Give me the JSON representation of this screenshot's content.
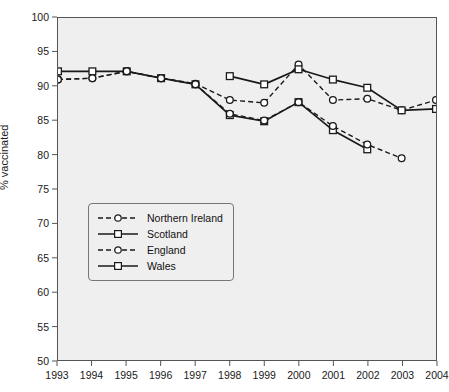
{
  "chart_data": {
    "type": "line",
    "title": "",
    "xlabel": "",
    "ylabel": "% vaccinated",
    "x": [
      1993,
      1994,
      1995,
      1996,
      1997,
      1998,
      1999,
      2000,
      2001,
      2002,
      2003,
      2004
    ],
    "xtick_labels": [
      "1993",
      "1994",
      "1995",
      "1996",
      "1997",
      "1998",
      "1999",
      "2000",
      "2001",
      "2002",
      "2003",
      "2004"
    ],
    "ytick_labels": [
      "50",
      "55",
      "60",
      "65",
      "70",
      "75",
      "80",
      "85",
      "90",
      "95",
      "100"
    ],
    "ytick_values": [
      50,
      55,
      60,
      65,
      70,
      75,
      80,
      85,
      90,
      95,
      100
    ],
    "ylim": [
      50,
      100
    ],
    "xlim": [
      1993,
      2004
    ],
    "grid": false,
    "legend_position": "center-left",
    "series": [
      {
        "name": "Northern Ireland",
        "style": "dashed",
        "marker": "circle",
        "x": [
          1993,
          1994,
          1995,
          1996,
          1997,
          1998,
          1999,
          2000,
          2001,
          2002,
          2003,
          2004
        ],
        "values": [
          91.0,
          91.2,
          92.2,
          91.2,
          90.4,
          88.0,
          87.6,
          93.2,
          88.0,
          88.2,
          86.5,
          88.0
        ]
      },
      {
        "name": "Scotland",
        "style": "solid",
        "marker": "square",
        "x": [
          1993,
          1994,
          1995,
          1996,
          1997,
          1998,
          1999,
          2000,
          2001,
          2002
        ],
        "values": [
          92.2,
          92.2,
          92.2,
          91.2,
          90.3,
          85.8,
          84.9,
          87.7,
          83.6,
          80.8
        ]
      },
      {
        "name": "England",
        "style": "dashed",
        "marker": "circle",
        "x": [
          1993,
          1994,
          1995,
          1996,
          1997,
          1998,
          1999,
          2000,
          2001,
          2002,
          2003
        ],
        "values": [
          91.0,
          91.2,
          92.2,
          91.2,
          90.3,
          86.0,
          85.0,
          87.7,
          84.2,
          81.5,
          79.5
        ]
      },
      {
        "name": "Wales",
        "style": "solid",
        "marker": "square",
        "x": [
          1998,
          1999,
          2000,
          2001,
          2002,
          2003,
          2004
        ],
        "values": [
          91.5,
          90.3,
          92.5,
          91.0,
          89.8,
          86.5,
          86.7
        ]
      }
    ]
  },
  "legend": {
    "items": [
      {
        "label": "Northern Ireland"
      },
      {
        "label": "Scotland"
      },
      {
        "label": "England"
      },
      {
        "label": "Wales"
      }
    ]
  },
  "colors": {
    "line": "#1a1a1a",
    "plot_background": "#efefef",
    "frame": "#555555",
    "page_background": "#ffffff",
    "marker_fill": "#ffffff"
  }
}
